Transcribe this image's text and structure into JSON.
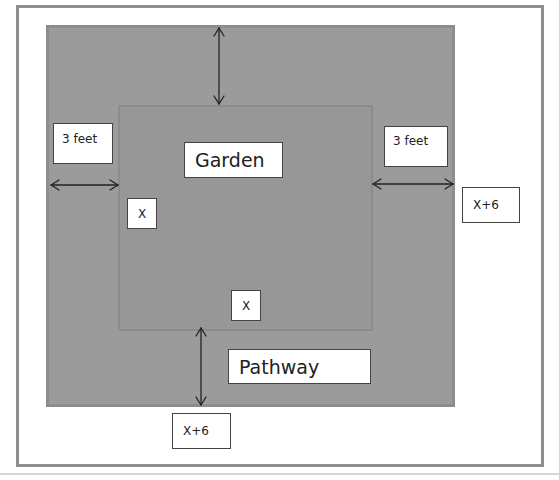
{
  "diagram": {
    "colors": {
      "frame_border": "#8e8e8e",
      "pathway_fill": "#9b9b9b",
      "garden_fill": "#979797",
      "label_bg": "#ffffff",
      "arrow": "#222222"
    },
    "labels": {
      "garden": "Garden",
      "pathway": "Pathway",
      "left_width": "3 feet",
      "right_width": "3 feet",
      "garden_side_left": "X",
      "garden_side_bottom": "X",
      "outer_side_right": "X+6",
      "outer_side_bottom": "X+6"
    },
    "arrows": [
      {
        "name": "top-pathway-width",
        "direction": "vertical"
      },
      {
        "name": "left-pathway-width",
        "direction": "horizontal"
      },
      {
        "name": "right-pathway-width",
        "direction": "horizontal"
      },
      {
        "name": "bottom-pathway-width",
        "direction": "vertical"
      }
    ]
  }
}
